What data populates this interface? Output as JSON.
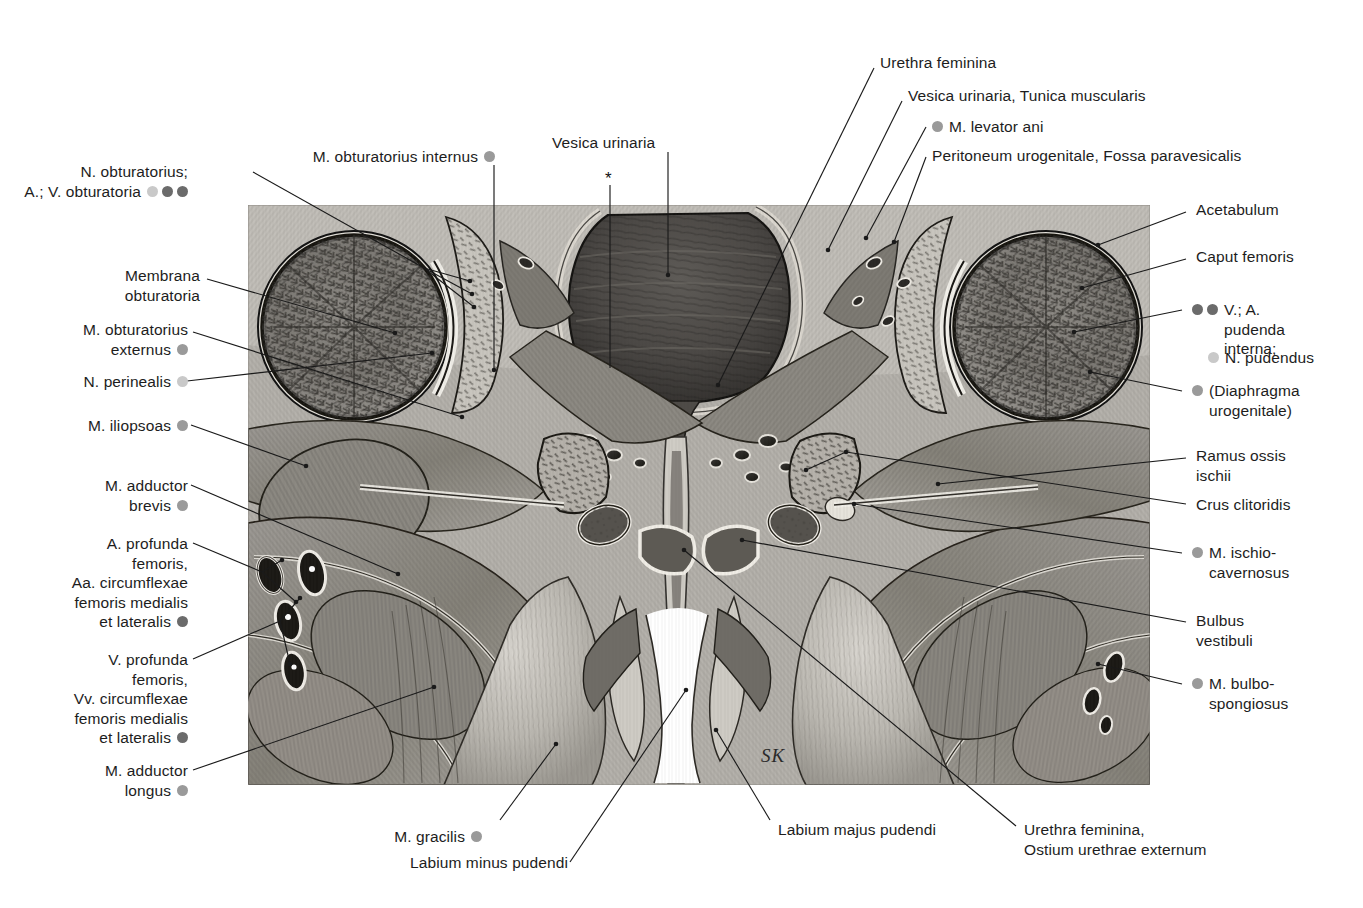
{
  "plate": {
    "title": "Frontal section through the female pelvis and perineum",
    "signature": "SK",
    "asterisk": "*"
  },
  "labels_left": [
    {
      "id": "n-obturatorius",
      "text": "N. obturatorius;\nA.; V. obturatoria"
    },
    {
      "id": "membrana-obturatoria",
      "text": "Membrana\nobturatoria"
    },
    {
      "id": "m-obturatorius-externus",
      "text": "M. obturatorius\nexternus"
    },
    {
      "id": "n-perinealis",
      "text": "N. perinealis"
    },
    {
      "id": "m-iliopsoas",
      "text": "M. iliopsoas"
    },
    {
      "id": "m-adductor-brevis",
      "text": "M. adductor\nbrevis"
    },
    {
      "id": "a-profunda-femoris",
      "text": "A. profunda\nfemoris,\nAa. circumflexae\nfemoris medialis\net lateralis"
    },
    {
      "id": "v-profunda-femoris",
      "text": "V. profunda\nfemoris,\nVv. circumflexae\nfemoris medialis\net lateralis"
    },
    {
      "id": "m-adductor-longus",
      "text": "M. adductor\nlongus"
    }
  ],
  "labels_top": [
    {
      "id": "m-obturatorius-internus",
      "text": "M. obturatorius internus"
    },
    {
      "id": "vesica-urinaria",
      "text": "Vesica urinaria"
    },
    {
      "id": "urethra-feminina",
      "text": "Urethra feminina"
    },
    {
      "id": "vesica-tunica",
      "text": "Vesica urinaria, Tunica muscularis"
    },
    {
      "id": "m-levator-ani",
      "text": "M. levator ani"
    },
    {
      "id": "peritoneum-urogenitale",
      "text": "Peritoneum urogenitale, Fossa paravesicalis"
    }
  ],
  "labels_right": [
    {
      "id": "acetabulum",
      "text": "Acetabulum"
    },
    {
      "id": "caput-femoris",
      "text": "Caput femoris"
    },
    {
      "id": "v-a-pudenda",
      "text": "V.; A.\npudenda\ninterna;"
    },
    {
      "id": "n-pudendus",
      "text": "N. pudendus"
    },
    {
      "id": "diaphragma-urogenitale",
      "text": "(Diaphragma\nurogenitale)"
    },
    {
      "id": "ramus-ossis-ischii",
      "text": "Ramus ossis\nischii"
    },
    {
      "id": "crus-clitoridis",
      "text": "Crus clitoridis"
    },
    {
      "id": "m-ischiocavernosus",
      "text": "M. ischio-\ncavernosus"
    },
    {
      "id": "bulbus-vestibuli",
      "text": "Bulbus\nvestibuli"
    },
    {
      "id": "m-bulbospongiosus",
      "text": "M. bulbo-\nspongiosus"
    }
  ],
  "labels_bottom": [
    {
      "id": "m-gracilis",
      "text": "M. gracilis"
    },
    {
      "id": "labium-minus",
      "text": "Labium minus pudendi"
    },
    {
      "id": "labium-majus",
      "text": "Labium majus pudendi"
    },
    {
      "id": "urethra-ostium",
      "text": "Urethra feminina,\nOstium urethrae externum"
    }
  ],
  "key_colors": {
    "nerve_light": "#c9c9c9",
    "muscle_medium": "#9a9a9a",
    "vessel_dark": "#6b6b6b",
    "line": "#1a1a1a",
    "background": "#ffffff"
  }
}
